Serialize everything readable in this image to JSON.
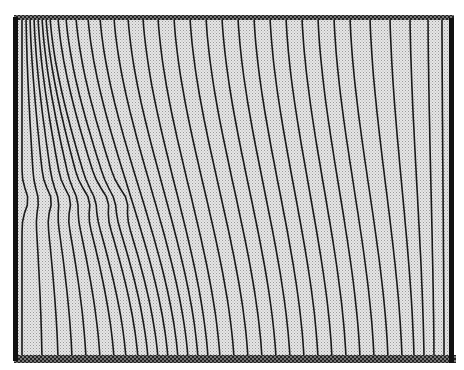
{
  "figure": {
    "type": "curvilinear-grid-lines",
    "frame": {
      "x0": 16,
      "y0": 18,
      "x1": 452,
      "y1": 358
    },
    "colors": {
      "background": "#ffffff",
      "fill": "#d8d8d8",
      "line": "#1a1a1a",
      "border": "#111111",
      "top_edge": "#555555",
      "bottom_edge": "#333333"
    },
    "top_x": [
      22,
      26,
      30,
      34,
      38,
      42,
      46,
      50,
      58,
      66,
      76,
      88,
      100,
      114,
      128,
      143,
      158,
      174,
      190,
      206,
      222,
      238,
      254,
      270,
      286,
      302,
      318,
      334,
      350,
      370,
      390,
      410,
      428,
      442
    ],
    "bottom_x": [
      22,
      42,
      58,
      72,
      86,
      100,
      114,
      126,
      138,
      148,
      158,
      168,
      178,
      188,
      198,
      208,
      220,
      234,
      248,
      262,
      276,
      290,
      304,
      318,
      332,
      346,
      360,
      374,
      388,
      402,
      414,
      424,
      434,
      444
    ],
    "kink": {
      "y": 200,
      "region_x": [
        20,
        80
      ],
      "amplitude": 6
    }
  }
}
